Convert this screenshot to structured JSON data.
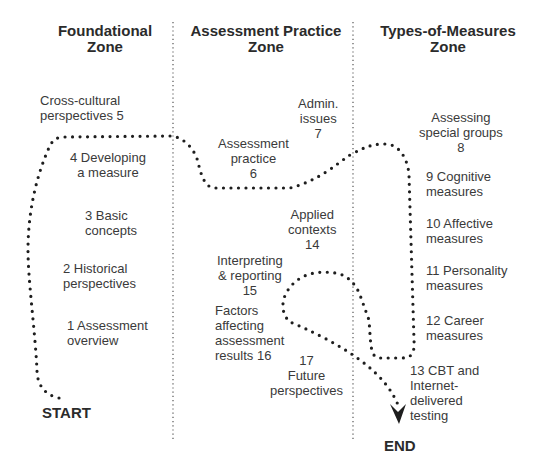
{
  "zones": [
    {
      "title": "Foundational\nZone"
    },
    {
      "title": "Assessment Practice\nZone"
    },
    {
      "title": "Types-of-Measures\nZone"
    }
  ],
  "topics": {
    "t1": "1 Assessment\n    overview",
    "t2": "2 Historical\n   perspectives",
    "t3": "3 Basic\n   concepts",
    "t4": "4 Developing\n  a measure",
    "t5": "Cross-cultural\nperspectives  5",
    "t6": "Assessment\npractice\n6",
    "t7": "Admin.\nissues\n7",
    "t8": "Assessing\nspecial groups\n8",
    "t9": "9 Cognitive\n   measures",
    "t10": "10 Affective\n     measures",
    "t11": "11 Personality\n     measures",
    "t12": "12 Career\n     measures",
    "t13": "13 CBT and\n     Internet-\n     delivered\n     testing",
    "t14": "Applied\ncontexts\n14",
    "t15": "Interpreting\n& reporting\n15",
    "t16": "Factors\naffecting\nassessment\nresults 16",
    "t17": "17\nFuture\nperspectives"
  },
  "markers": {
    "start": "START",
    "end": "END"
  },
  "colors": {
    "path": "#1e1e1e",
    "divider": "#555555",
    "text": "#2b2b2b"
  }
}
